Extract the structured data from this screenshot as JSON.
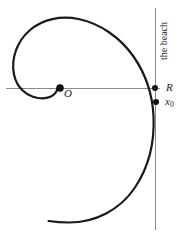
{
  "figure": {
    "type": "geometry-diagram",
    "background_color": "#ffffff",
    "curve_color": "#1a1a1a",
    "axis_color": "#808080",
    "point_color": "#111111"
  },
  "labels": {
    "origin": "O",
    "radius": "R",
    "start_base": "x",
    "start_sub": "0",
    "beach": "the beach"
  },
  "points": [
    {
      "name": "origin-point",
      "label": "O",
      "x": 60,
      "y": 88
    },
    {
      "name": "radius-point",
      "label": "R",
      "x": 155,
      "y": 88
    },
    {
      "name": "start-point",
      "label": "x0",
      "x": 156,
      "y": 102
    }
  ],
  "lines": {
    "horizontal_axis": {
      "x1": 6,
      "y1": 88,
      "x2": 160,
      "y2": 88
    },
    "beach_line": {
      "x1": 155,
      "y1": 8,
      "x2": 155,
      "y2": 230
    }
  },
  "curve": {
    "name": "spiral-curve",
    "path": "M 57.5 88.5 C 55.5 96.5 47.0 99.5 38.0 98.0 C 26.0 96.0 16.5 87.0 14.0 74.5 C 10.8 58.5 17.0 41.5 29.5 30.5 C 42.5 19.0 61.0 15.5 78.5 19.0 C 100.5 23.5 120.5 38.0 133.5 56.5 C 146.0 74.5 152.5 95.5 153.5 116.0 C 154.7 141.0 149.0 166.5 135.0 187.5 C 120.0 210.0 95.0 222.5 69.0 222.5 C 62.0 222.5 55.0 222.0 48.5 221.0",
    "stroke_width": 2.2
  }
}
